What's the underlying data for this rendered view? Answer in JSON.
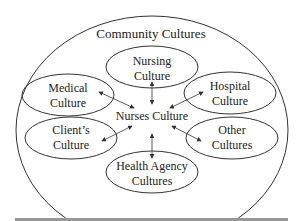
{
  "diagram": {
    "outer_label": "Community Cultures",
    "center_label": "Nurses Culture",
    "nodes": [
      {
        "id": "nursing",
        "line1": "Nursing",
        "line2": "Culture"
      },
      {
        "id": "medical",
        "line1": "Medical",
        "line2": "Culture"
      },
      {
        "id": "hospital",
        "line1": "Hospital",
        "line2": "Culture"
      },
      {
        "id": "clients",
        "line1": "Client’s",
        "line2": "Culture"
      },
      {
        "id": "other",
        "line1": "Other",
        "line2": "Cultures"
      },
      {
        "id": "health_agency",
        "line1": "Health Agency",
        "line2": "Cultures"
      }
    ],
    "colors": {
      "stroke": "#333333",
      "bar": "#999999"
    }
  }
}
